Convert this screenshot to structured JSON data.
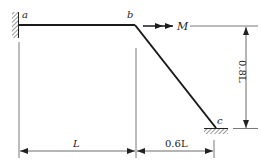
{
  "diagram": {
    "type": "structural-frame",
    "nodes": {
      "a": {
        "label": "a",
        "support": "fixed-wall-left"
      },
      "b": {
        "label": "b",
        "support": "none"
      },
      "c": {
        "label": "c",
        "support": "fixed-ground-bottom"
      }
    },
    "members": [
      {
        "from": "a",
        "to": "b",
        "orientation": "horizontal"
      },
      {
        "from": "b",
        "to": "c",
        "orientation": "inclined"
      }
    ],
    "load": {
      "label": "M",
      "at": "b",
      "symbol": "double-arrow-right"
    },
    "dimensions": {
      "ab_horizontal": "L",
      "bc_horizontal": "0.6L",
      "bc_vertical": "0.8L"
    }
  },
  "colors": {
    "line": "#1a1a1a",
    "thin": "#555555",
    "background": "#ffffff"
  }
}
